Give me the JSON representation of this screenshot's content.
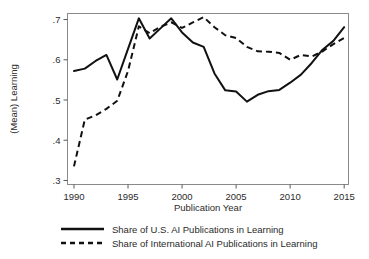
{
  "chart_data": {
    "type": "line",
    "title": "",
    "xlabel": "Publication Year",
    "ylabel": "(Mean) Learning",
    "xlim": [
      1989.4,
      2015.4
    ],
    "ylim": [
      0.29,
      0.715
    ],
    "grid": false,
    "legend_position": "bottom",
    "xticks": [
      "1990",
      "1995",
      "2000",
      "2005",
      "2010",
      "2015"
    ],
    "xtick_values": [
      1990,
      1995,
      2000,
      2005,
      2010,
      2015
    ],
    "yticks": [
      ".3",
      ".4",
      ".5",
      ".6",
      ".7"
    ],
    "ytick_values": [
      0.3,
      0.4,
      0.5,
      0.6,
      0.7
    ],
    "x": [
      1990,
      1991,
      1992,
      1993,
      1994,
      1995,
      1996,
      1997,
      1998,
      1999,
      2000,
      2001,
      2002,
      2003,
      2004,
      2005,
      2006,
      2007,
      2008,
      2009,
      2010,
      2011,
      2012,
      2013,
      2014,
      2015
    ],
    "series": [
      {
        "name": "Share of U.S. AI Publications in Learning",
        "style": "solid",
        "values": [
          0.572,
          0.578,
          0.597,
          0.612,
          0.551,
          0.627,
          0.703,
          0.653,
          0.678,
          0.703,
          0.668,
          0.643,
          0.632,
          0.566,
          0.524,
          0.521,
          0.496,
          0.513,
          0.522,
          0.525,
          0.543,
          0.563,
          0.592,
          0.625,
          0.647,
          0.681
        ]
      },
      {
        "name": "Share of International AI Publications in Learning",
        "style": "dashed",
        "values": [
          0.335,
          0.451,
          0.462,
          0.478,
          0.498,
          0.572,
          0.683,
          0.666,
          0.682,
          0.693,
          0.679,
          0.693,
          0.706,
          0.681,
          0.661,
          0.654,
          0.632,
          0.621,
          0.62,
          0.617,
          0.6,
          0.612,
          0.608,
          0.621,
          0.639,
          0.654
        ]
      }
    ]
  },
  "legend": {
    "entries": [
      {
        "label": "Share of U.S. AI Publications in Learning",
        "style": "solid"
      },
      {
        "label": "Share of International AI Publications in Learning",
        "style": "dashed"
      }
    ]
  }
}
